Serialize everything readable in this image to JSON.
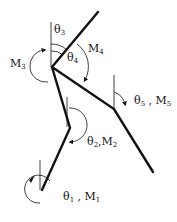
{
  "diagram": {
    "type": "multi-segment linkage with joint angles and moments",
    "colors": {
      "line": "#111111",
      "background": "#ffffff"
    },
    "labels": {
      "theta1": {
        "sym": "θ",
        "sub": "1",
        "sep": " , ",
        "m": "M",
        "msub": "1"
      },
      "theta2": {
        "sym": "θ",
        "sub": "2",
        "sep": ",",
        "m": "M",
        "msub": "2"
      },
      "theta3": {
        "sym": "θ",
        "sub": "3"
      },
      "theta4": {
        "sym": "θ",
        "sub": "4"
      },
      "theta5": {
        "sym": "θ",
        "sub": "5",
        "sep": " , ",
        "m": "M",
        "msub": "5"
      },
      "m3": {
        "m": "M",
        "msub": "3"
      },
      "m4": {
        "m": "M",
        "msub": "4"
      }
    },
    "joints": [
      {
        "name": "ankle",
        "x": 42,
        "y": 190
      },
      {
        "name": "knee",
        "x": 70,
        "y": 128
      },
      {
        "name": "hip",
        "x": 52,
        "y": 67
      },
      {
        "name": "upper-end",
        "x": 98,
        "y": 12
      },
      {
        "name": "elbow",
        "x": 114,
        "y": 109
      },
      {
        "name": "lower-end",
        "x": 153,
        "y": 172
      }
    ]
  }
}
